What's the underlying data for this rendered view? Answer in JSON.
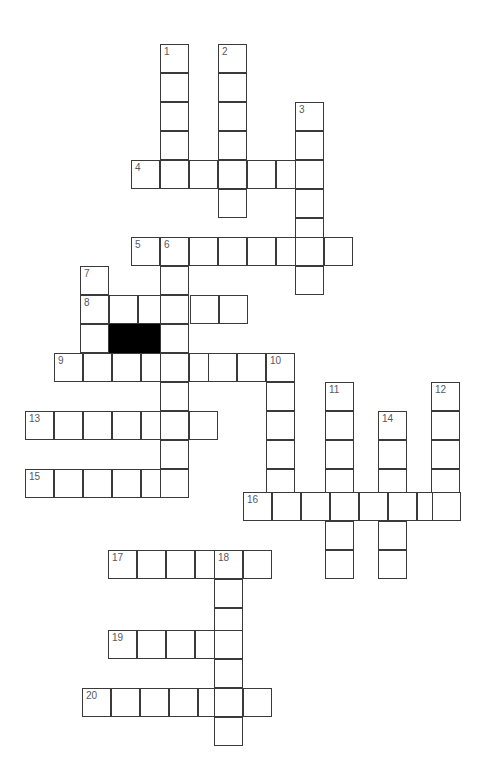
{
  "puzzle": {
    "title": "Crossword Puzzle Grid",
    "type": "crossword-grid",
    "canvas": {
      "width": 487,
      "height": 780,
      "background": "#ffffff"
    },
    "cell": {
      "size": 29,
      "border_color": "#3a3a3a",
      "fill_color": "#ffffff",
      "block_color": "#000000"
    },
    "number_color": "#55595e",
    "counts": {
      "clue_numbers": 20,
      "across_entries": 10,
      "down_entries": 10,
      "block_cells": 2
    },
    "entries": [
      {
        "number": "1",
        "direction": "down",
        "x": 160,
        "y": 44,
        "length": 5
      },
      {
        "number": "2",
        "direction": "down",
        "x": 218,
        "y": 44,
        "length": 6
      },
      {
        "number": "3",
        "direction": "down",
        "x": 295,
        "y": 102,
        "length": 7
      },
      {
        "number": "4",
        "direction": "across",
        "x": 131,
        "y": 160,
        "length": 7
      },
      {
        "number": "5",
        "direction": "across",
        "x": 131,
        "y": 237,
        "length": 8
      },
      {
        "number": "6",
        "direction": "down",
        "x": 160,
        "y": 237,
        "length": 9
      },
      {
        "number": "7",
        "direction": "down",
        "x": 80,
        "y": 266,
        "length": 4
      },
      {
        "number": "8",
        "direction": "across",
        "x": 80,
        "y": 295,
        "length": 6
      },
      {
        "number": "9",
        "direction": "across",
        "x": 54,
        "y": 353,
        "length": 9
      },
      {
        "number": "10",
        "direction": "down",
        "x": 266,
        "y": 353,
        "length": 6
      },
      {
        "number": "11",
        "direction": "down",
        "x": 325,
        "y": 382,
        "length": 7
      },
      {
        "number": "12",
        "direction": "down",
        "x": 431,
        "y": 382,
        "length": 5
      },
      {
        "number": "13",
        "direction": "across",
        "x": 25,
        "y": 411,
        "length": 7
      },
      {
        "number": "14",
        "direction": "down",
        "x": 378,
        "y": 411,
        "length": 6
      },
      {
        "number": "15",
        "direction": "across",
        "x": 25,
        "y": 469,
        "length": 6
      },
      {
        "number": "16",
        "direction": "across",
        "x": 243,
        "y": 492,
        "length": 8
      },
      {
        "number": "17",
        "direction": "across",
        "x": 108,
        "y": 550,
        "length": 6
      },
      {
        "number": "18",
        "direction": "down",
        "x": 214,
        "y": 550,
        "length": 7
      },
      {
        "number": "19",
        "direction": "across",
        "x": 108,
        "y": 630,
        "length": 5
      },
      {
        "number": "20",
        "direction": "across",
        "x": 82,
        "y": 688,
        "length": 7
      }
    ],
    "cells": [
      {
        "x": 160,
        "y": 44,
        "number": "1"
      },
      {
        "x": 160,
        "y": 73
      },
      {
        "x": 160,
        "y": 102
      },
      {
        "x": 160,
        "y": 131
      },
      {
        "x": 218,
        "y": 44,
        "number": "2"
      },
      {
        "x": 218,
        "y": 73
      },
      {
        "x": 218,
        "y": 102
      },
      {
        "x": 218,
        "y": 131
      },
      {
        "x": 295,
        "y": 102,
        "number": "3"
      },
      {
        "x": 295,
        "y": 131
      },
      {
        "x": 131,
        "y": 160,
        "number": "4"
      },
      {
        "x": 160,
        "y": 160
      },
      {
        "x": 189,
        "y": 160
      },
      {
        "x": 218,
        "y": 160
      },
      {
        "x": 247,
        "y": 160
      },
      {
        "x": 276,
        "y": 160
      },
      {
        "x": 295,
        "y": 160
      },
      {
        "x": 218,
        "y": 189
      },
      {
        "x": 295,
        "y": 189
      },
      {
        "x": 295,
        "y": 218
      },
      {
        "x": 131,
        "y": 237,
        "number": "5"
      },
      {
        "x": 160,
        "y": 237,
        "number": "6"
      },
      {
        "x": 189,
        "y": 237
      },
      {
        "x": 218,
        "y": 237
      },
      {
        "x": 247,
        "y": 237
      },
      {
        "x": 276,
        "y": 237
      },
      {
        "x": 295,
        "y": 237
      },
      {
        "x": 324,
        "y": 237
      },
      {
        "x": 295,
        "y": 266
      },
      {
        "x": 80,
        "y": 266,
        "number": "7"
      },
      {
        "x": 160,
        "y": 266
      },
      {
        "x": 80,
        "y": 295,
        "number": "8"
      },
      {
        "x": 109,
        "y": 295
      },
      {
        "x": 138,
        "y": 295
      },
      {
        "x": 160,
        "y": 295
      },
      {
        "x": 190,
        "y": 295
      },
      {
        "x": 219,
        "y": 295
      },
      {
        "x": 80,
        "y": 324
      },
      {
        "x": 109,
        "y": 324,
        "block": true
      },
      {
        "x": 138,
        "y": 324,
        "block": true
      },
      {
        "x": 160,
        "y": 324
      },
      {
        "x": 54,
        "y": 353,
        "number": "9"
      },
      {
        "x": 83,
        "y": 353
      },
      {
        "x": 112,
        "y": 353
      },
      {
        "x": 141,
        "y": 353
      },
      {
        "x": 160,
        "y": 353
      },
      {
        "x": 189,
        "y": 353
      },
      {
        "x": 208,
        "y": 353
      },
      {
        "x": 237,
        "y": 353
      },
      {
        "x": 266,
        "y": 353,
        "number": "10"
      },
      {
        "x": 160,
        "y": 382
      },
      {
        "x": 266,
        "y": 382
      },
      {
        "x": 325,
        "y": 382,
        "number": "11"
      },
      {
        "x": 431,
        "y": 382,
        "number": "12"
      },
      {
        "x": 25,
        "y": 411,
        "number": "13"
      },
      {
        "x": 54,
        "y": 411
      },
      {
        "x": 83,
        "y": 411
      },
      {
        "x": 112,
        "y": 411
      },
      {
        "x": 141,
        "y": 411
      },
      {
        "x": 160,
        "y": 411
      },
      {
        "x": 189,
        "y": 411
      },
      {
        "x": 266,
        "y": 411
      },
      {
        "x": 325,
        "y": 411
      },
      {
        "x": 378,
        "y": 411,
        "number": "14"
      },
      {
        "x": 431,
        "y": 411
      },
      {
        "x": 160,
        "y": 440
      },
      {
        "x": 266,
        "y": 440
      },
      {
        "x": 325,
        "y": 440
      },
      {
        "x": 378,
        "y": 440
      },
      {
        "x": 431,
        "y": 440
      },
      {
        "x": 25,
        "y": 469,
        "number": "15"
      },
      {
        "x": 54,
        "y": 469
      },
      {
        "x": 83,
        "y": 469
      },
      {
        "x": 112,
        "y": 469
      },
      {
        "x": 141,
        "y": 469
      },
      {
        "x": 160,
        "y": 469
      },
      {
        "x": 266,
        "y": 469
      },
      {
        "x": 325,
        "y": 469
      },
      {
        "x": 378,
        "y": 469
      },
      {
        "x": 431,
        "y": 469
      },
      {
        "x": 243,
        "y": 492,
        "number": "16"
      },
      {
        "x": 272,
        "y": 492
      },
      {
        "x": 301,
        "y": 492
      },
      {
        "x": 330,
        "y": 492
      },
      {
        "x": 359,
        "y": 492
      },
      {
        "x": 388,
        "y": 492
      },
      {
        "x": 417,
        "y": 492
      },
      {
        "x": 432,
        "y": 492
      },
      {
        "x": 325,
        "y": 521
      },
      {
        "x": 378,
        "y": 521
      },
      {
        "x": 325,
        "y": 550
      },
      {
        "x": 378,
        "y": 550
      },
      {
        "x": 108,
        "y": 550,
        "number": "17"
      },
      {
        "x": 137,
        "y": 550
      },
      {
        "x": 166,
        "y": 550
      },
      {
        "x": 195,
        "y": 550
      },
      {
        "x": 214,
        "y": 550,
        "number": "18"
      },
      {
        "x": 243,
        "y": 550
      },
      {
        "x": 214,
        "y": 579
      },
      {
        "x": 214,
        "y": 608
      },
      {
        "x": 108,
        "y": 630,
        "number": "19"
      },
      {
        "x": 137,
        "y": 630
      },
      {
        "x": 166,
        "y": 630
      },
      {
        "x": 195,
        "y": 630
      },
      {
        "x": 214,
        "y": 630
      },
      {
        "x": 214,
        "y": 659
      },
      {
        "x": 82,
        "y": 688,
        "number": "20"
      },
      {
        "x": 111,
        "y": 688
      },
      {
        "x": 140,
        "y": 688
      },
      {
        "x": 169,
        "y": 688
      },
      {
        "x": 198,
        "y": 688
      },
      {
        "x": 214,
        "y": 688
      },
      {
        "x": 243,
        "y": 688
      },
      {
        "x": 214,
        "y": 717
      }
    ]
  }
}
